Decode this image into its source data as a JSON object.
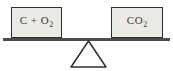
{
  "diagram": {
    "left_pan": {
      "formula": "C + O",
      "subscript": "2"
    },
    "right_pan": {
      "formula": "CO",
      "subscript": "2"
    },
    "colors": {
      "background": "#ffffff",
      "box_fill": "#eceae5",
      "box_border": "#2f2f2f",
      "beam": "#4d4d4d",
      "fulcrum_stroke": "#2f2f2f",
      "fulcrum_fill": "#ffffff"
    }
  }
}
